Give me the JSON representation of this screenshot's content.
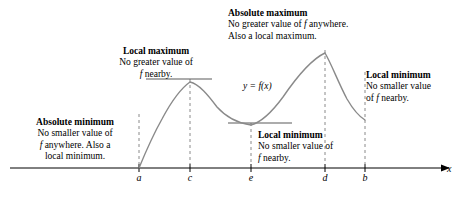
{
  "figure": {
    "curve_label": "y = f(x)",
    "axis_label_x": "x",
    "colors": {
      "curve": "#8a8a8a",
      "axis": "#000000",
      "dashed": "#8a8a8a",
      "tangent": "#5a5a5a",
      "text": "#000000"
    }
  },
  "annotations": [
    {
      "id": "local-maximum",
      "title": "Local maximum",
      "lines": [
        "No greater value of",
        "f nearby."
      ],
      "align": "center",
      "at_tick": "c"
    },
    {
      "id": "absolute-maximum",
      "title": "Absolute maximum",
      "lines": [
        "No greater value of f anywhere.",
        "Also a local maximum."
      ],
      "align": "left",
      "at_tick": "d"
    },
    {
      "id": "absolute-minimum",
      "title": "Absolute minimum",
      "lines": [
        "No smaller value of",
        "f anywhere. Also a",
        "local minimum."
      ],
      "align": "center",
      "at_tick": "a"
    },
    {
      "id": "local-minimum",
      "title": "Local minimum",
      "lines": [
        "No smaller value of",
        "f nearby."
      ],
      "align": "left",
      "at_tick": "e"
    },
    {
      "id": "local-minimum-right",
      "title": "Local minimum",
      "lines": [
        "No smaller value",
        "of f nearby."
      ],
      "align": "left",
      "at_tick": "b"
    }
  ],
  "axis": {
    "ticks": [
      {
        "label": "a",
        "x": 139
      },
      {
        "label": "c",
        "x": 190
      },
      {
        "label": "e",
        "x": 251
      },
      {
        "label": "d",
        "x": 325
      },
      {
        "label": "b",
        "x": 365
      }
    ],
    "baseline_y": 168,
    "x_start": 10,
    "x_end": 444
  },
  "chart_data": {
    "type": "line",
    "xlabel": "x",
    "ylabel": "",
    "curve_label": "y = f(x)",
    "critical_points": [
      {
        "x_label": "a",
        "kind": "absolute minimum",
        "note": "endpoint; also a local minimum",
        "y_px": 168
      },
      {
        "x_label": "c",
        "kind": "local maximum",
        "note": "no greater value of f nearby",
        "y_px": 82
      },
      {
        "x_label": "e",
        "kind": "local minimum",
        "note": "no smaller value of f nearby",
        "y_px": 125
      },
      {
        "x_label": "d",
        "kind": "absolute maximum",
        "note": "no greater value of f anywhere; also a local maximum",
        "y_px": 53
      },
      {
        "x_label": "b",
        "kind": "local minimum",
        "note": "endpoint; no smaller value of f nearby",
        "y_px": 120
      }
    ],
    "tangent_segments": [
      {
        "at": "c",
        "x1": 146,
        "x2": 212,
        "y": 79
      },
      {
        "at": "e",
        "x1": 228,
        "x2": 292,
        "y": 123
      }
    ],
    "curve_points_px": [
      [
        139,
        168
      ],
      [
        147,
        150
      ],
      [
        156,
        131
      ],
      [
        165,
        114
      ],
      [
        175,
        98
      ],
      [
        183,
        88
      ],
      [
        190,
        82
      ],
      [
        198,
        83
      ],
      [
        207,
        91
      ],
      [
        216,
        103
      ],
      [
        226,
        114
      ],
      [
        236,
        121
      ],
      [
        245,
        125
      ],
      [
        251,
        125
      ],
      [
        258,
        123
      ],
      [
        268,
        116
      ],
      [
        278,
        104
      ],
      [
        288,
        90
      ],
      [
        300,
        74
      ],
      [
        312,
        61
      ],
      [
        320,
        55
      ],
      [
        325,
        53
      ],
      [
        331,
        60
      ],
      [
        338,
        76
      ],
      [
        345,
        93
      ],
      [
        353,
        106
      ],
      [
        360,
        115
      ],
      [
        365,
        120
      ]
    ],
    "grid": false,
    "legend": "none"
  }
}
